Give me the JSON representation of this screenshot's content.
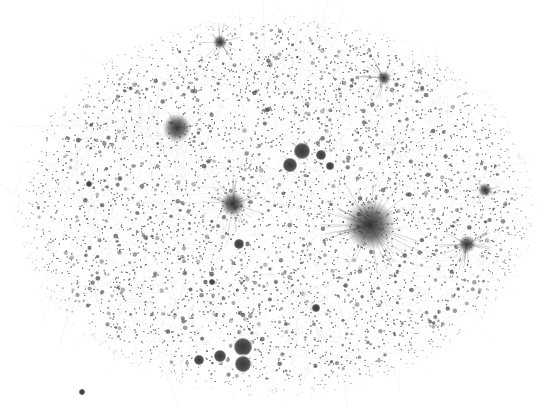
{
  "figure": {
    "type": "network-graph",
    "background": "#ffffff",
    "cloud_color": "#9a9a9a",
    "node_color": "#5a5a5a",
    "hub_color": "#3a3a3a",
    "boundary": {
      "cx": 275,
      "cy": 205,
      "rx": 245,
      "ry": 180
    },
    "hubs": [
      {
        "x": 370,
        "y": 225,
        "r": 14,
        "rays": 40,
        "ray_len": 48
      },
      {
        "x": 233,
        "y": 204,
        "r": 7,
        "rays": 24,
        "ray_len": 30
      },
      {
        "x": 177,
        "y": 128,
        "r": 8,
        "rays": 14,
        "ray_len": 18
      },
      {
        "x": 467,
        "y": 244,
        "r": 5,
        "rays": 20,
        "ray_len": 26
      },
      {
        "x": 384,
        "y": 78,
        "r": 4,
        "rays": 18,
        "ray_len": 24
      },
      {
        "x": 220,
        "y": 42,
        "r": 4,
        "rays": 14,
        "ray_len": 20
      },
      {
        "x": 485,
        "y": 190,
        "r": 4,
        "rays": 10,
        "ray_len": 16
      }
    ],
    "blobs": [
      {
        "x": 302,
        "y": 151,
        "r": 8
      },
      {
        "x": 290,
        "y": 165,
        "r": 7
      },
      {
        "x": 321,
        "y": 155,
        "r": 5
      },
      {
        "x": 330,
        "y": 166,
        "r": 4
      },
      {
        "x": 243,
        "y": 347,
        "r": 9
      },
      {
        "x": 243,
        "y": 364,
        "r": 8
      },
      {
        "x": 220,
        "y": 356,
        "r": 6
      },
      {
        "x": 199,
        "y": 360,
        "r": 5
      },
      {
        "x": 239,
        "y": 244,
        "r": 5
      },
      {
        "x": 316,
        "y": 308,
        "r": 4
      },
      {
        "x": 212,
        "y": 282,
        "r": 3
      },
      {
        "x": 89,
        "y": 184,
        "r": 3
      },
      {
        "x": 82,
        "y": 392,
        "r": 3
      }
    ]
  }
}
